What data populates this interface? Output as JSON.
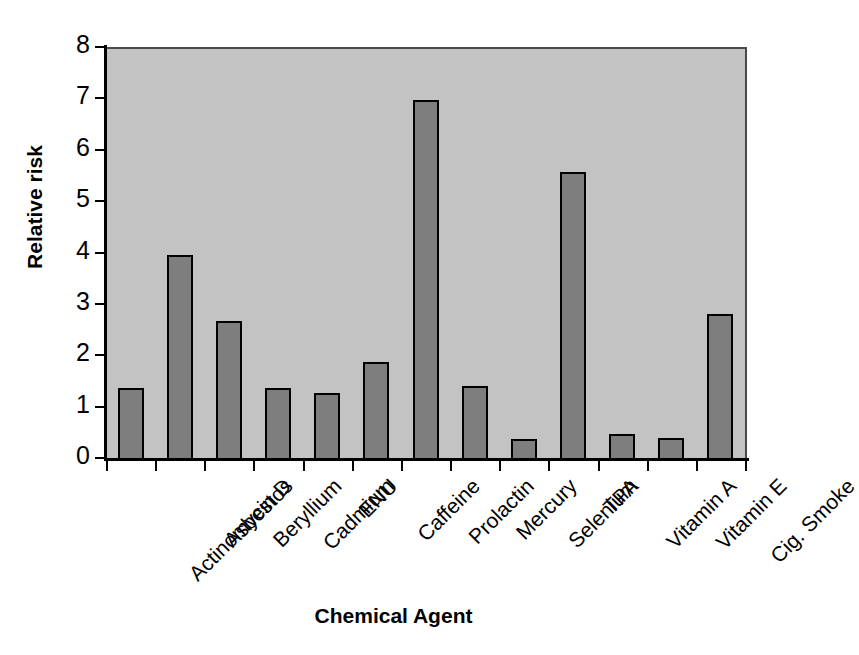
{
  "chart_data": {
    "type": "bar",
    "title": "",
    "subtitle": "",
    "xlabel": "Chemical Agent",
    "ylabel": "Relative risk",
    "categories": [
      "Actinomycin D",
      "Asbestos",
      "Beryllium",
      "Cadmium",
      "ENU",
      "Caffeine",
      "Prolactin",
      "Mercury",
      "Selenium",
      "TPA",
      "Vitamin A",
      "Vitamin E",
      "Cig. Smoke"
    ],
    "values": [
      1.4,
      4.0,
      2.7,
      1.4,
      1.3,
      1.9,
      7.0,
      1.45,
      0.4,
      5.6,
      0.5,
      0.42,
      2.85
    ],
    "ylim": [
      0,
      8
    ],
    "ytick_labels": [
      "0",
      "1",
      "2",
      "3",
      "4",
      "5",
      "6",
      "7",
      "8"
    ],
    "ytick_values": [
      0,
      1,
      2,
      3,
      4,
      5,
      6,
      7,
      8
    ],
    "grid": false,
    "legend": "none",
    "bar_fill_color": "#7e7e7e",
    "bar_edge_color": "#000000",
    "plot_background_color": "#c3c3c3",
    "figure_background_color": "#ffffff",
    "axis_color": "#000000",
    "xtick_label_rotation": -45
  }
}
